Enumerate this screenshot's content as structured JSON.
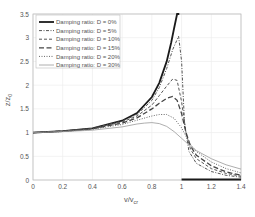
{
  "chart_data": {
    "type": "line",
    "title": "",
    "xlabel": "v/v_cr",
    "xlabel_main": "v/v",
    "xlabel_sub": "cr",
    "ylabel": "z/z_0",
    "ylabel_main": "z/z",
    "ylabel_sub": "0",
    "xlim": [
      0,
      1.4
    ],
    "ylim": [
      0,
      3.5
    ],
    "xticks": [
      "0",
      "0.2",
      "0.4",
      "0.6",
      "0.8",
      "1",
      "1.2",
      "1.4"
    ],
    "yticks": [
      "0",
      "0.5",
      "1",
      "1.5",
      "2",
      "2.5",
      "3",
      "3.5"
    ],
    "grid": true,
    "legend_position": "upper left",
    "series": [
      {
        "name": "Damping ratio: D = 0%",
        "style": "solid-thick",
        "x": [
          0,
          0.2,
          0.4,
          0.6,
          0.7,
          0.8,
          0.85,
          0.9,
          0.93,
          0.95,
          0.97,
          0.985
        ],
        "y": [
          1.0,
          1.03,
          1.09,
          1.25,
          1.41,
          1.75,
          2.05,
          2.5,
          2.9,
          3.2,
          3.5,
          3.5
        ]
      },
      {
        "name": "Damping ratio: D = 5%",
        "style": "dash-dot",
        "x": [
          0,
          0.2,
          0.4,
          0.6,
          0.7,
          0.8,
          0.85,
          0.9,
          0.94,
          0.98,
          1.0,
          1.02,
          1.05,
          1.1,
          1.2,
          1.3,
          1.4
        ],
        "y": [
          1.0,
          1.03,
          1.09,
          1.24,
          1.38,
          1.68,
          1.95,
          2.35,
          2.75,
          3.03,
          2.5,
          1.2,
          0.6,
          0.35,
          0.18,
          0.1,
          0.06
        ]
      },
      {
        "name": "Damping ratio: D = 10%",
        "style": "dashed",
        "x": [
          0,
          0.2,
          0.4,
          0.6,
          0.7,
          0.8,
          0.85,
          0.9,
          0.94,
          0.97,
          1.0,
          1.03,
          1.06,
          1.1,
          1.2,
          1.3,
          1.4
        ],
        "y": [
          1.0,
          1.03,
          1.08,
          1.22,
          1.35,
          1.58,
          1.78,
          1.98,
          2.13,
          2.1,
          1.65,
          1.0,
          0.65,
          0.45,
          0.24,
          0.14,
          0.08
        ]
      },
      {
        "name": "Damping ratio: D = 15%",
        "style": "long-dash",
        "x": [
          0,
          0.2,
          0.4,
          0.6,
          0.7,
          0.8,
          0.85,
          0.9,
          0.94,
          0.97,
          1.0,
          1.03,
          1.06,
          1.1,
          1.2,
          1.3,
          1.4
        ],
        "y": [
          1.0,
          1.03,
          1.08,
          1.2,
          1.31,
          1.5,
          1.62,
          1.72,
          1.76,
          1.68,
          1.4,
          1.0,
          0.72,
          0.52,
          0.3,
          0.17,
          0.1
        ]
      },
      {
        "name": "Damping ratio: D = 20%",
        "style": "dotted",
        "x": [
          0,
          0.2,
          0.4,
          0.6,
          0.7,
          0.8,
          0.85,
          0.9,
          0.95,
          1.0,
          1.03,
          1.06,
          1.1,
          1.2,
          1.3,
          1.4
        ],
        "y": [
          1.0,
          1.02,
          1.07,
          1.17,
          1.26,
          1.35,
          1.38,
          1.38,
          1.3,
          1.1,
          0.92,
          0.75,
          0.6,
          0.38,
          0.24,
          0.15
        ]
      },
      {
        "name": "Damping ratio: D = 30%",
        "style": "thin-solid",
        "x": [
          0,
          0.2,
          0.4,
          0.6,
          0.7,
          0.75,
          0.8,
          0.85,
          0.9,
          0.95,
          1.0,
          1.05,
          1.1,
          1.2,
          1.3,
          1.4
        ],
        "y": [
          1.0,
          1.02,
          1.05,
          1.12,
          1.18,
          1.2,
          1.21,
          1.19,
          1.13,
          1.02,
          0.88,
          0.74,
          0.62,
          0.45,
          0.32,
          0.23
        ]
      }
    ],
    "annotations": [
      {
        "type": "thick-baseline",
        "x_from": 1.0,
        "x_to": 1.4,
        "y": 0,
        "series": "Damping ratio: D = 0%"
      }
    ]
  }
}
